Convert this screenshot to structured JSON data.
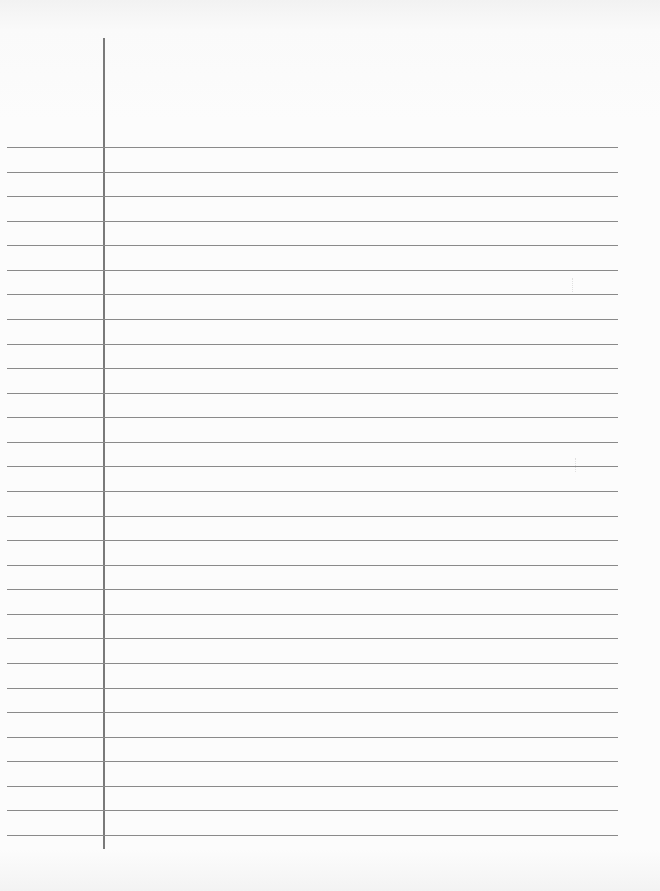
{
  "document": {
    "type": "lined-paper",
    "rule_count": 29,
    "rule_first_y": 147,
    "rule_spacing": 24.57,
    "margin_line_x": 103,
    "colors": {
      "paper": "#fcfcfc",
      "rule": "#8a8a8a",
      "margin": "#7a7a7a"
    }
  }
}
